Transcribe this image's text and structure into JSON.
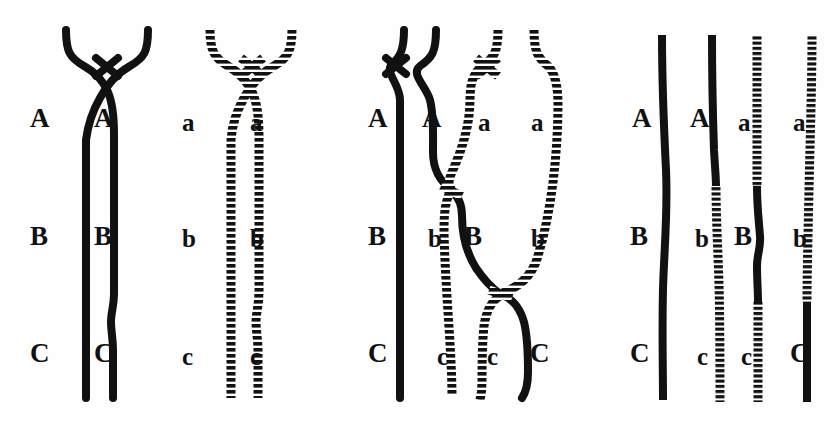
{
  "figure": {
    "background_color": "#fefefe",
    "ink_color": "#111111",
    "width": 833,
    "height": 426
  },
  "chart_data": {
    "type": "diagram",
    "xlabel": "",
    "ylabel": "",
    "legend": [
      {
        "key": "solid",
        "description": "solid black chromatid (maternal homolog)",
        "color": "#111111"
      },
      {
        "key": "hatched",
        "description": "hatched / ladder chromatid (paternal homolog)",
        "color": "#111111"
      }
    ],
    "loci": [
      "A",
      "B",
      "C"
    ],
    "alleles_solid": [
      "A",
      "B",
      "C"
    ],
    "alleles_hatched": [
      "a",
      "b",
      "c"
    ],
    "panels": [
      {
        "index": 1,
        "name": "panel-1-solid-bivalent",
        "caption": "",
        "chromatids": [
          {
            "id": "p1-s1",
            "texture": "solid",
            "segments": [
              {
                "allele": "A",
                "texture": "solid"
              },
              {
                "allele": "B",
                "texture": "solid"
              },
              {
                "allele": "C",
                "texture": "solid"
              }
            ]
          },
          {
            "id": "p1-s2",
            "texture": "solid",
            "segments": [
              {
                "allele": "A",
                "texture": "solid"
              },
              {
                "allele": "B",
                "texture": "solid"
              },
              {
                "allele": "C",
                "texture": "solid"
              }
            ]
          }
        ],
        "labels": [
          {
            "text": "A",
            "x": 30,
            "y": 105,
            "case": "upper"
          },
          {
            "text": "A",
            "x": 94,
            "y": 105,
            "case": "upper"
          },
          {
            "text": "B",
            "x": 30,
            "y": 223,
            "case": "upper"
          },
          {
            "text": "B",
            "x": 94,
            "y": 223,
            "case": "upper"
          },
          {
            "text": "C",
            "x": 30,
            "y": 340,
            "case": "upper"
          },
          {
            "text": "C",
            "x": 94,
            "y": 340,
            "case": "upper"
          }
        ]
      },
      {
        "index": 2,
        "name": "panel-2-hatched-bivalent",
        "caption": "",
        "chromatids": [
          {
            "id": "p2-h1",
            "texture": "hatched",
            "segments": [
              {
                "allele": "a",
                "texture": "hatched"
              },
              {
                "allele": "b",
                "texture": "hatched"
              },
              {
                "allele": "c",
                "texture": "hatched"
              }
            ]
          },
          {
            "id": "p2-h2",
            "texture": "hatched",
            "segments": [
              {
                "allele": "a",
                "texture": "hatched"
              },
              {
                "allele": "b",
                "texture": "hatched"
              },
              {
                "allele": "c",
                "texture": "hatched"
              }
            ]
          }
        ],
        "labels": [
          {
            "text": "a",
            "x": 182,
            "y": 110,
            "case": "lower"
          },
          {
            "text": "a",
            "x": 250,
            "y": 110,
            "case": "lower"
          },
          {
            "text": "b",
            "x": 182,
            "y": 226,
            "case": "lower"
          },
          {
            "text": "b",
            "x": 250,
            "y": 226,
            "case": "lower"
          },
          {
            "text": "c",
            "x": 182,
            "y": 344,
            "case": "lower"
          },
          {
            "text": "c",
            "x": 250,
            "y": 344,
            "case": "lower"
          }
        ]
      },
      {
        "index": 3,
        "name": "panel-3-chiasmata",
        "caption": "",
        "chiasmata": 2,
        "chromatids": [
          {
            "id": "p3-1",
            "texture": "solid",
            "segments": [
              {
                "allele": "A",
                "texture": "solid"
              },
              {
                "allele": "B",
                "texture": "solid"
              },
              {
                "allele": "C",
                "texture": "solid"
              }
            ]
          },
          {
            "id": "p3-2",
            "texture": "mixed",
            "segments": [
              {
                "allele": "A",
                "texture": "solid"
              },
              {
                "allele": "b",
                "texture": "hatched"
              },
              {
                "allele": "c",
                "texture": "hatched"
              }
            ]
          },
          {
            "id": "p3-3",
            "texture": "mixed",
            "segments": [
              {
                "allele": "a",
                "texture": "hatched"
              },
              {
                "allele": "B",
                "texture": "solid"
              },
              {
                "allele": "c",
                "texture": "hatched"
              }
            ]
          },
          {
            "id": "p3-4",
            "texture": "mixed",
            "segments": [
              {
                "allele": "a",
                "texture": "hatched"
              },
              {
                "allele": "b",
                "texture": "hatched"
              },
              {
                "allele": "C",
                "texture": "solid"
              }
            ]
          }
        ],
        "labels": [
          {
            "text": "A",
            "x": 368,
            "y": 105,
            "case": "upper"
          },
          {
            "text": "A",
            "x": 422,
            "y": 105,
            "case": "upper"
          },
          {
            "text": "a",
            "x": 478,
            "y": 110,
            "case": "lower"
          },
          {
            "text": "a",
            "x": 531,
            "y": 110,
            "case": "lower"
          },
          {
            "text": "B",
            "x": 368,
            "y": 223,
            "case": "upper"
          },
          {
            "text": "b",
            "x": 428,
            "y": 226,
            "case": "lower"
          },
          {
            "text": "B",
            "x": 464,
            "y": 223,
            "case": "upper"
          },
          {
            "text": "b",
            "x": 531,
            "y": 226,
            "case": "lower"
          },
          {
            "text": "C",
            "x": 368,
            "y": 340,
            "case": "upper"
          },
          {
            "text": "c",
            "x": 437,
            "y": 344,
            "case": "lower"
          },
          {
            "text": "c",
            "x": 487,
            "y": 344,
            "case": "lower"
          },
          {
            "text": "C",
            "x": 530,
            "y": 340,
            "case": "upper"
          }
        ]
      },
      {
        "index": 4,
        "name": "panel-4-recombinant-products",
        "caption": "",
        "chromatids": [
          {
            "id": "p4-1",
            "texture": "solid",
            "segments": [
              {
                "allele": "A",
                "texture": "solid"
              },
              {
                "allele": "B",
                "texture": "solid"
              },
              {
                "allele": "C",
                "texture": "solid"
              }
            ]
          },
          {
            "id": "p4-2",
            "texture": "mixed",
            "segments": [
              {
                "allele": "A",
                "texture": "solid"
              },
              {
                "allele": "b",
                "texture": "hatched"
              },
              {
                "allele": "c",
                "texture": "hatched"
              }
            ]
          },
          {
            "id": "p4-3",
            "texture": "mixed",
            "segments": [
              {
                "allele": "a",
                "texture": "hatched"
              },
              {
                "allele": "B",
                "texture": "solid"
              },
              {
                "allele": "c",
                "texture": "hatched"
              }
            ]
          },
          {
            "id": "p4-4",
            "texture": "mixed",
            "segments": [
              {
                "allele": "a",
                "texture": "hatched"
              },
              {
                "allele": "b",
                "texture": "hatched"
              },
              {
                "allele": "C",
                "texture": "solid"
              }
            ]
          }
        ],
        "labels": [
          {
            "text": "A",
            "x": 632,
            "y": 105,
            "case": "upper"
          },
          {
            "text": "A",
            "x": 690,
            "y": 105,
            "case": "upper"
          },
          {
            "text": "a",
            "x": 738,
            "y": 110,
            "case": "lower"
          },
          {
            "text": "a",
            "x": 793,
            "y": 110,
            "case": "lower"
          },
          {
            "text": "B",
            "x": 630,
            "y": 223,
            "case": "upper"
          },
          {
            "text": "b",
            "x": 695,
            "y": 226,
            "case": "lower"
          },
          {
            "text": "B",
            "x": 734,
            "y": 223,
            "case": "upper"
          },
          {
            "text": "b",
            "x": 793,
            "y": 226,
            "case": "lower"
          },
          {
            "text": "C",
            "x": 630,
            "y": 340,
            "case": "upper"
          },
          {
            "text": "c",
            "x": 697,
            "y": 344,
            "case": "lower"
          },
          {
            "text": "c",
            "x": 741,
            "y": 344,
            "case": "lower"
          },
          {
            "text": "C",
            "x": 790,
            "y": 340,
            "case": "upper"
          }
        ]
      }
    ]
  }
}
